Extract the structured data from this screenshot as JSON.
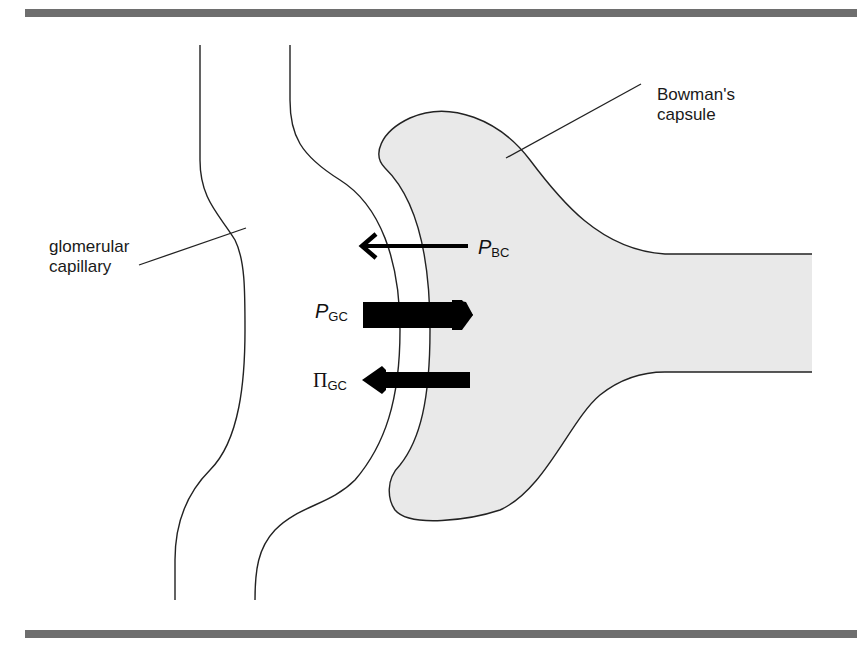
{
  "figure": {
    "labels": {
      "bowmans_capsule_line1": "Bowman's",
      "bowmans_capsule_line2": "capsule",
      "glomerular_line1": "glomerular",
      "glomerular_line2": "capillary"
    },
    "forces": [
      {
        "symbol": "P",
        "subscript": "BC",
        "direction": "left",
        "weight": "thin"
      },
      {
        "symbol": "P",
        "subscript": "GC",
        "direction": "right",
        "weight": "thick"
      },
      {
        "symbol": "Π",
        "subscript": "GC",
        "direction": "left",
        "weight": "thick"
      }
    ],
    "colors": {
      "rule": "#6e6e6e",
      "capsule_fill": "#e9e9e9",
      "stroke": "#222222",
      "arrow": "#000000"
    }
  }
}
